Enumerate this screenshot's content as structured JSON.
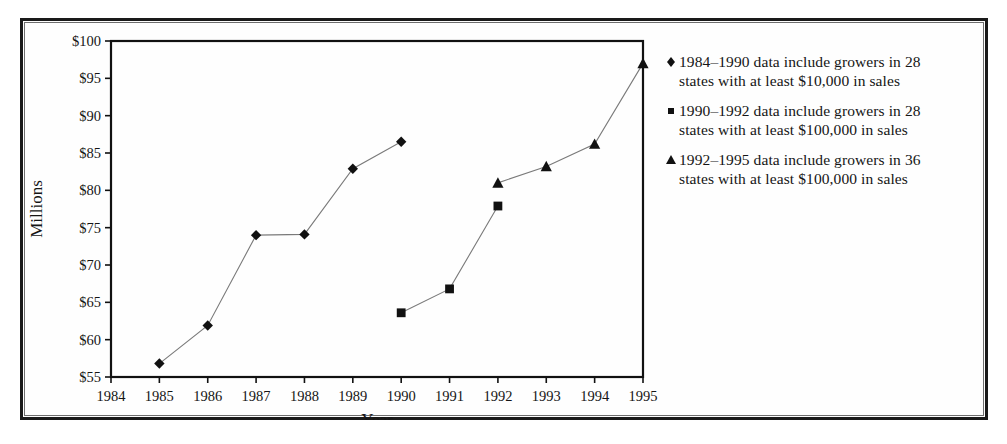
{
  "figure": {
    "background_color": "#ffffff",
    "frame_color": "#1a1a1a"
  },
  "chart_data": {
    "type": "line",
    "title": "",
    "xlabel": "Year",
    "ylabel": "Millions",
    "xlim": [
      1984,
      1995
    ],
    "ylim": [
      55,
      100
    ],
    "x": [
      1984,
      1985,
      1986,
      1987,
      1988,
      1989,
      1990,
      1991,
      1992,
      1993,
      1994,
      1995
    ],
    "xtick_labels": [
      "1984",
      "1985",
      "1986",
      "1987",
      "1988",
      "1989",
      "1990",
      "1991",
      "1992",
      "1993",
      "1994",
      "1995"
    ],
    "ytick_values": [
      55,
      60,
      65,
      70,
      75,
      80,
      85,
      90,
      95,
      100
    ],
    "ytick_labels": [
      "$55",
      "$60",
      "$65",
      "$70",
      "$75",
      "$80",
      "$85",
      "$90",
      "$95",
      "$100"
    ],
    "grid": false,
    "legend_position": "right",
    "line_color": "#7a7a7a",
    "marker_color": "#111111",
    "series": [
      {
        "name": "1984–1990 data include growers in 28 states with at least $10,000 in sales",
        "marker": "diamond",
        "x": [
          1985,
          1986,
          1987,
          1988,
          1989,
          1990
        ],
        "values": [
          56.8,
          61.9,
          74.0,
          74.1,
          82.9,
          86.5
        ]
      },
      {
        "name": "1990–1992 data include growers in 28 states with at least $100,000 in sales",
        "marker": "square",
        "x": [
          1990,
          1991,
          1992
        ],
        "values": [
          63.6,
          66.8,
          77.9
        ]
      },
      {
        "name": "1992–1995 data include growers in 36 states with at least $100,000 in sales",
        "marker": "triangle",
        "x": [
          1992,
          1993,
          1994,
          1995
        ],
        "values": [
          81.0,
          83.2,
          86.2,
          97.0
        ]
      }
    ]
  },
  "legend": {
    "items": [
      {
        "marker": "diamond",
        "line1": "1984–1990 data include growers in 28",
        "line2": "states with at least $10,000 in sales"
      },
      {
        "marker": "square",
        "line1": "1990–1992 data include growers in 28",
        "line2": "states with at least $100,000 in sales"
      },
      {
        "marker": "triangle",
        "line1": "1992–1995 data include growers in 36",
        "line2": "states with at least $100,000 in sales"
      }
    ]
  },
  "axes": {
    "y_title": "Millions",
    "x_title": "Year"
  }
}
